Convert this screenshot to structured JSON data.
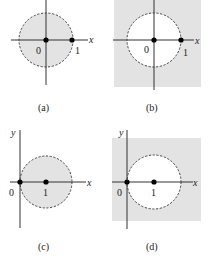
{
  "colors": {
    "shade": "#e3e3e3",
    "axis": "#333333",
    "circle": "#333333",
    "point": "#000000",
    "background": "#ffffff"
  },
  "panels": [
    {
      "id": "a",
      "caption": "(a)",
      "shaded": "inside",
      "axes": {
        "x_label": "x",
        "y_label": ""
      },
      "points": [
        {
          "label": "0"
        },
        {
          "label": "1"
        }
      ],
      "circle": {
        "center": "0",
        "radius": 1,
        "style": "dashed"
      }
    },
    {
      "id": "b",
      "caption": "(b)",
      "shaded": "outside",
      "axes": {
        "x_label": "x",
        "y_label": ""
      },
      "points": [
        {
          "label": "0"
        },
        {
          "label": "1"
        }
      ],
      "circle": {
        "center": "0",
        "radius": 1,
        "style": "dashed"
      }
    },
    {
      "id": "c",
      "caption": "(c)",
      "shaded": "inside",
      "axes": {
        "x_label": "x",
        "y_label": "y"
      },
      "points": [
        {
          "label": "0"
        },
        {
          "label": "1"
        }
      ],
      "circle": {
        "center": "1",
        "radius": 1,
        "style": "dashed"
      }
    },
    {
      "id": "d",
      "caption": "(d)",
      "shaded": "outside",
      "axes": {
        "x_label": "x",
        "y_label": "y"
      },
      "points": [
        {
          "label": "0"
        },
        {
          "label": "1"
        }
      ],
      "circle": {
        "center": "1",
        "radius": 1,
        "style": "dashed"
      }
    }
  ]
}
